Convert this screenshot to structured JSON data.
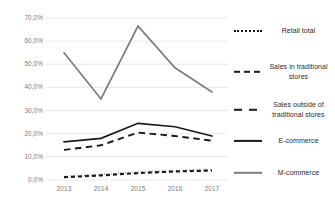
{
  "chart_data": {
    "type": "line",
    "title": "",
    "xlabel": "",
    "ylabel": "",
    "categories": [
      "2013",
      "2014",
      "2015",
      "2016",
      "2017"
    ],
    "x_tick_labels": [
      "2013",
      "2014",
      "2015",
      "2016",
      "2017"
    ],
    "y_tick_labels": [
      "0,0%",
      "10,0%",
      "20,0%",
      "30,0%",
      "40,0%",
      "50,0%",
      "60,0%",
      "70,0%"
    ],
    "y_tick_values": [
      0,
      10,
      20,
      30,
      40,
      50,
      60,
      70
    ],
    "ylim": [
      0,
      70
    ],
    "grid": "horizontal",
    "legend_position": "right",
    "series": [
      {
        "name": "Retail total",
        "style": "dotted",
        "color": "#1a1a1a",
        "values": [
          1.5,
          2.4,
          3.4,
          4.1,
          4.5
        ]
      },
      {
        "name": "Sales in traditional stores",
        "style": "dashed-short",
        "color": "#1a1a1a",
        "values": [
          1.2,
          2.0,
          3.0,
          3.7,
          4.1
        ]
      },
      {
        "name": "Sales outside of traditional stores",
        "style": "dashed-long",
        "color": "#1a1a1a",
        "values": [
          13.0,
          15.0,
          20.5,
          19.0,
          17.0
        ]
      },
      {
        "name": "E-commerce",
        "style": "solid",
        "color": "#1a1a1a",
        "values": [
          16.5,
          18.0,
          24.5,
          23.0,
          19.0
        ]
      },
      {
        "name": "M-commerce",
        "style": "solid",
        "color": "#7d7d7d",
        "values": [
          55.0,
          35.0,
          66.5,
          48.5,
          38.0
        ]
      }
    ]
  },
  "legend": {
    "items": [
      {
        "label": "Retail total",
        "swatch": "dotted-line-icon"
      },
      {
        "label": "Sales in traditional stores",
        "swatch": "short-dashed-line-icon"
      },
      {
        "label": "Sales outside of traditional stores",
        "swatch": "long-dashed-line-icon"
      },
      {
        "label": "E-commerce",
        "swatch": "solid-black-line-icon"
      },
      {
        "label": "M-commerce",
        "swatch": "solid-gray-line-icon"
      }
    ]
  },
  "colors": {
    "grid": "#e9e9e9",
    "axis_text": "#7b7b7b",
    "series_black": "#1a1a1a",
    "series_gray": "#7d7d7d",
    "background": "#ffffff"
  }
}
